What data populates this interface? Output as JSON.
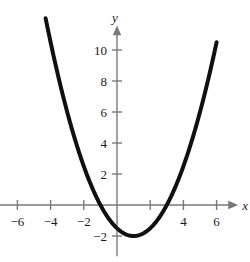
{
  "chart_data": {
    "type": "line",
    "title": "",
    "xlabel": "x",
    "ylabel": "y",
    "xlim": [
      -7.1,
      7.3
    ],
    "ylim": [
      -3.3,
      11.6
    ],
    "grid": false,
    "legend": null,
    "curve": {
      "name": "parabola",
      "equation": "y = 0.5(x - 1)^2 - 2",
      "vertex": [
        1,
        -2
      ],
      "roots": [
        -1,
        3
      ],
      "color": "#101010",
      "linewidth": 4,
      "x_domain": [
        -4.3,
        6
      ],
      "points": [
        {
          "x": -4.3,
          "y": 10.0
        },
        {
          "x": -4.0,
          "y": 10.5
        },
        {
          "x": -3.0,
          "y": 6.0
        },
        {
          "x": -2.0,
          "y": 2.5
        },
        {
          "x": -1.0,
          "y": 0.0
        },
        {
          "x": 0.0,
          "y": -1.5
        },
        {
          "x": 1.0,
          "y": -2.0
        },
        {
          "x": 2.0,
          "y": -1.5
        },
        {
          "x": 3.0,
          "y": 0.0
        },
        {
          "x": 4.0,
          "y": 2.5
        },
        {
          "x": 5.0,
          "y": 6.0
        },
        {
          "x": 6.0,
          "y": 10.5
        }
      ]
    },
    "x_ticks": [
      {
        "value": -6,
        "label": "−6"
      },
      {
        "value": -4,
        "label": "−4"
      },
      {
        "value": -2,
        "label": "−2"
      },
      {
        "value": 2,
        "label": ""
      },
      {
        "value": 4,
        "label": "4"
      },
      {
        "value": 6,
        "label": "6"
      }
    ],
    "y_ticks": [
      {
        "value": 10,
        "label": "10"
      },
      {
        "value": 8,
        "label": "8"
      },
      {
        "value": 6,
        "label": "6"
      },
      {
        "value": 4,
        "label": "4"
      },
      {
        "value": 2,
        "label": "2"
      },
      {
        "value": -2,
        "label": "−2"
      }
    ],
    "axis_color": "#7a7a7a",
    "background": "#ffffff"
  }
}
